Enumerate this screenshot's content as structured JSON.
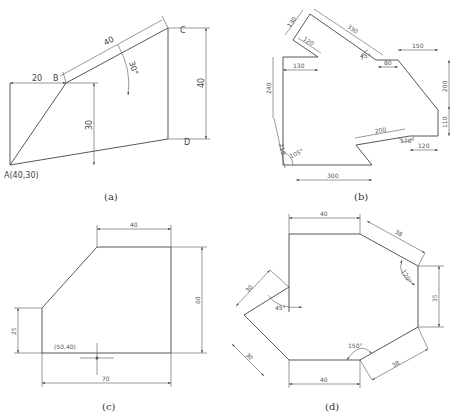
{
  "figures": {
    "a": {
      "caption": "(a)",
      "point_A": "A(40,30)",
      "point_B": "B",
      "point_C": "C",
      "point_D": "D",
      "dim_20": "20",
      "dim_40_slant": "40",
      "angle_30": "30°",
      "dim_30": "30",
      "dim_40_vert": "40"
    },
    "b": {
      "caption": "(b)",
      "dim_130_top": "130",
      "dim_120_top": "120",
      "dim_330": "330",
      "angle_45": "45°",
      "dim_80": "80",
      "dim_150": "150",
      "dim_130": "130",
      "dim_240": "240",
      "dim_200_vert": "200",
      "dim_110": "110",
      "dim_210": "210",
      "angle_105": "105°",
      "dim_200_slant": "200",
      "angle_170": "170°",
      "dim_120": "120",
      "dim_300": "300"
    },
    "c": {
      "caption": "(c)",
      "dim_40": "40",
      "dim_60": "60",
      "dim_25": "25",
      "point": "(50,40)",
      "dim_70": "70"
    },
    "d": {
      "caption": "(d)",
      "dim_40_top": "40",
      "dim_38_top": "38",
      "angle_120": "120°",
      "dim_35": "35",
      "dim_30_upper": "30",
      "angle_45": "45°",
      "dim_30_lower": "30",
      "angle_150": "150°",
      "dim_38_bottom": "38",
      "dim_40_bottom": "40"
    }
  }
}
